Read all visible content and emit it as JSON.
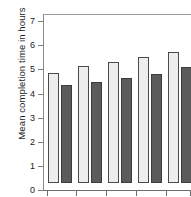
{
  "chart_data": {
    "type": "bar",
    "title": "",
    "subtitle": "",
    "xlabel": "",
    "ylabel": "Mean completion time in hours",
    "ylim": [
      0,
      7.3
    ],
    "yticks": [
      0,
      1,
      2,
      3,
      4,
      5,
      6,
      7
    ],
    "ytick_labels": [
      "0",
      "1",
      "2",
      "3",
      "4",
      "5",
      "6",
      "7"
    ],
    "grid": false,
    "legend": "none",
    "categories": [
      "1",
      "2",
      "3",
      "4",
      "5"
    ],
    "series": [
      {
        "name": "light",
        "color": "#ededed",
        "values": [
          4.58,
          4.85,
          5.02,
          5.22,
          5.45
        ]
      },
      {
        "name": "dark",
        "color": "#5b5b5b",
        "values": [
          4.08,
          4.2,
          4.36,
          4.52,
          4.8
        ]
      }
    ],
    "annotations": []
  },
  "axis": {
    "y_title": "Mean completion time in hours"
  }
}
